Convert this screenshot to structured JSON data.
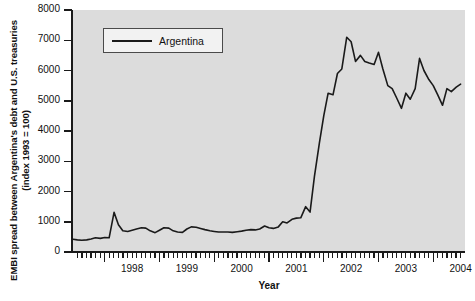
{
  "chart_data": {
    "type": "line",
    "title": "",
    "xlabel": "Year",
    "ylabel": "EMBI spread between Argentina's debt and U.S. treasuries (index 1993 = 100)",
    "ylabel_line1": "EMBI spread between Argentina's debt and U.S. treasuries",
    "ylabel_line2": "(index 1993 = 100)",
    "ylim": [
      0,
      8000
    ],
    "xlim": [
      1997.42,
      2004.58
    ],
    "ytick_labels": [
      "0",
      "1000",
      "2000",
      "3000",
      "4000",
      "5000",
      "6000",
      "7000",
      "8000"
    ],
    "ytick_values": [
      0,
      1000,
      2000,
      3000,
      4000,
      5000,
      6000,
      7000,
      8000
    ],
    "xtick_labels": [
      "1998",
      "1999",
      "2000",
      "2001",
      "2002",
      "2003",
      "2004"
    ],
    "xtick_values": [
      1998,
      1999,
      2000,
      2001,
      2002,
      2003,
      2004
    ],
    "minor_tick_interval_months": 1,
    "grid": false,
    "legend_position": "upper-left",
    "plot_background": "#dcdcdc",
    "figure_background": "#ffffff",
    "series": [
      {
        "name": "Argentina",
        "color": "#1a1a1a",
        "x": [
          1997.42,
          1997.5,
          1997.58,
          1997.67,
          1997.75,
          1997.83,
          1997.92,
          1998.0,
          1998.08,
          1998.17,
          1998.25,
          1998.33,
          1998.42,
          1998.5,
          1998.58,
          1998.67,
          1998.75,
          1998.83,
          1998.92,
          1999.0,
          1999.08,
          1999.17,
          1999.25,
          1999.33,
          1999.42,
          1999.5,
          1999.58,
          1999.67,
          1999.75,
          1999.83,
          1999.92,
          2000.0,
          2000.08,
          2000.17,
          2000.25,
          2000.33,
          2000.42,
          2000.5,
          2000.58,
          2000.67,
          2000.75,
          2000.83,
          2000.92,
          2001.0,
          2001.08,
          2001.17,
          2001.25,
          2001.33,
          2001.42,
          2001.5,
          2001.58,
          2001.67,
          2001.75,
          2001.83,
          2001.92,
          2002.0,
          2002.08,
          2002.17,
          2002.25,
          2002.33,
          2002.42,
          2002.5,
          2002.58,
          2002.67,
          2002.75,
          2002.83,
          2002.92,
          2003.0,
          2003.08,
          2003.17,
          2003.25,
          2003.33,
          2003.42,
          2003.5,
          2003.58,
          2003.67,
          2003.75,
          2003.83,
          2003.92,
          2004.0,
          2004.08,
          2004.17,
          2004.25,
          2004.33,
          2004.42,
          2004.5
        ],
        "values": [
          420,
          400,
          390,
          400,
          430,
          470,
          450,
          480,
          470,
          1310,
          900,
          700,
          680,
          720,
          760,
          800,
          790,
          700,
          640,
          720,
          800,
          790,
          700,
          660,
          650,
          760,
          830,
          820,
          780,
          740,
          700,
          680,
          660,
          660,
          660,
          650,
          670,
          690,
          720,
          740,
          730,
          760,
          860,
          800,
          780,
          830,
          1000,
          960,
          1080,
          1120,
          1130,
          1500,
          1320,
          2500,
          3600,
          4500,
          5250,
          5200,
          5900,
          6050,
          7100,
          6950,
          6300,
          6500,
          6300,
          6250,
          6200,
          6600,
          6050,
          5500,
          5400,
          5100,
          4750,
          5250,
          5050,
          5400,
          6400,
          6000,
          5700,
          5500,
          5200,
          4850,
          5400,
          5300,
          5450,
          5550
        ]
      }
    ]
  },
  "legend": {
    "entries": [
      {
        "label": "Argentina"
      }
    ]
  }
}
